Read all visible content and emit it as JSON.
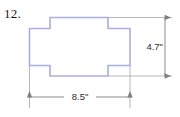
{
  "figure": {
    "problem_number": "12.",
    "shape_name": "cross-polygon",
    "outline_color": "#A9AEDC",
    "fill_color": "#FFFFFF",
    "dimension_line_color": "#808080",
    "extension_line_color": "#9A9A9A",
    "label_color": "#1A1A1A"
  },
  "dimensions": {
    "height": {
      "value": "4.7\"",
      "orientation": "vertical",
      "position": "right"
    },
    "width": {
      "value": "8.5\"",
      "orientation": "horizontal",
      "position": "bottom"
    }
  }
}
